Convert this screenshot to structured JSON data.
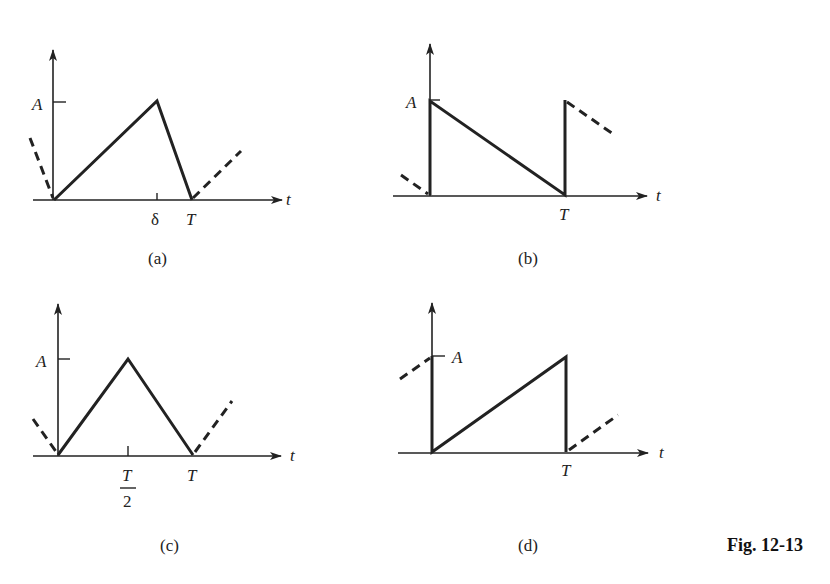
{
  "figure_label": "Fig. 12-13",
  "panels": [
    {
      "id": "a",
      "caption": "(a)",
      "waveform": "asymmetric triangular (rise to A at δ, fall to 0 at T)",
      "y_label": "A",
      "x_axis_label": "t",
      "x_ticks": [
        "δ",
        "T"
      ]
    },
    {
      "id": "b",
      "caption": "(b)",
      "waveform": "sawtooth falling from A to 0 over period T",
      "y_label": "A",
      "x_axis_label": "t",
      "x_ticks": [
        "T"
      ]
    },
    {
      "id": "c",
      "caption": "(c)",
      "waveform": "symmetric triangular (peak A at T/2)",
      "y_label": "A",
      "x_axis_label": "t",
      "x_ticks": [
        "T",
        "2",
        "T"
      ]
    },
    {
      "id": "d",
      "caption": "(d)",
      "waveform": "sawtooth rising from 0 to A over period T",
      "y_label": "A",
      "x_axis_label": "t",
      "x_ticks": [
        "T"
      ]
    }
  ]
}
